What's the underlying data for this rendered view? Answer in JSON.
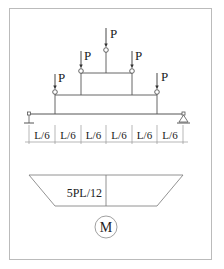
{
  "diagram": {
    "load_label": "P",
    "loads": [
      {
        "label": "P",
        "x": 55,
        "node_y": 91,
        "level": 1
      },
      {
        "label": "P",
        "x": 81,
        "node_y": 70,
        "level": 2
      },
      {
        "label": "P",
        "x": 106,
        "node_y": 50,
        "level": 3
      },
      {
        "label": "P",
        "x": 132,
        "node_y": 70,
        "level": 2
      },
      {
        "label": "P",
        "x": 157,
        "node_y": 91,
        "level": 1
      }
    ],
    "spans": [
      "L/6",
      "L/6",
      "L/6",
      "L/6",
      "L/6",
      "L/6"
    ],
    "supports": {
      "left": "pin-support",
      "right": "roller-support"
    },
    "moment_diagram": {
      "shape": "trapezoid",
      "max_value_label": "5PL/12"
    },
    "diagram_label": "M",
    "colors": {
      "line": "#555555",
      "frame": "#bbbbbb",
      "text": "#222222"
    }
  }
}
